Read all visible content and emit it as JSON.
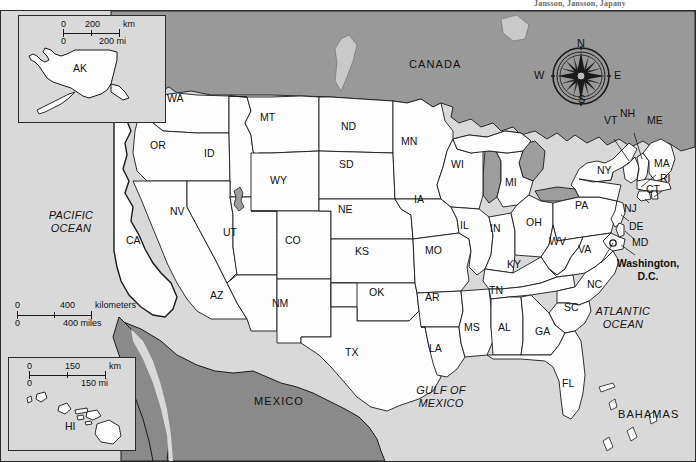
{
  "header": {
    "note": "Jansson, Jansson, Japany"
  },
  "map": {
    "title": "United States reference map",
    "countries": [
      {
        "name": "CANADA",
        "label": "CANADA",
        "x": 413,
        "y": 56
      },
      {
        "name": "MEXICO",
        "label": "MEXICO",
        "x": 258,
        "y": 394
      },
      {
        "name": "BAHAMAS",
        "label": "BAHAMAS",
        "x": 622,
        "y": 407
      }
    ],
    "waters": [
      {
        "name": "PACIFIC OCEAN",
        "line1": "PACIFIC",
        "line2": "OCEAN",
        "x": 38,
        "y": 210
      },
      {
        "name": "ATLANTIC OCEAN",
        "line1": "ATLANTIC",
        "line2": "OCEAN",
        "x": 589,
        "y": 305
      },
      {
        "name": "GULF OF MEXICO",
        "line1": "GULF OF",
        "line2": "MEXICO",
        "x": 413,
        "y": 384
      }
    ],
    "capital": {
      "name": "Washington, D.C.",
      "line1": "Washington,",
      "line2": "D.C.",
      "x": 613,
      "y": 258
    },
    "states": [
      {
        "code": "WA",
        "x": 175,
        "y": 98
      },
      {
        "code": "OR",
        "x": 158,
        "y": 145
      },
      {
        "code": "CA",
        "x": 134,
        "y": 240
      },
      {
        "code": "ID",
        "x": 212,
        "y": 153
      },
      {
        "code": "NV",
        "x": 178,
        "y": 211
      },
      {
        "code": "UT",
        "x": 231,
        "y": 232
      },
      {
        "code": "AZ",
        "x": 218,
        "y": 295
      },
      {
        "code": "MT",
        "x": 268,
        "y": 117
      },
      {
        "code": "WY",
        "x": 278,
        "y": 180
      },
      {
        "code": "CO",
        "x": 293,
        "y": 240
      },
      {
        "code": "NM",
        "x": 280,
        "y": 303
      },
      {
        "code": "ND",
        "x": 349,
        "y": 126
      },
      {
        "code": "SD",
        "x": 347,
        "y": 164
      },
      {
        "code": "NE",
        "x": 346,
        "y": 209
      },
      {
        "code": "KS",
        "x": 363,
        "y": 251
      },
      {
        "code": "OK",
        "x": 377,
        "y": 292
      },
      {
        "code": "TX",
        "x": 353,
        "y": 352
      },
      {
        "code": "MN",
        "x": 409,
        "y": 141
      },
      {
        "code": "IA",
        "x": 422,
        "y": 199
      },
      {
        "code": "MO",
        "x": 433,
        "y": 250
      },
      {
        "code": "AR",
        "x": 433,
        "y": 297
      },
      {
        "code": "LA",
        "x": 437,
        "y": 348
      },
      {
        "code": "WI",
        "x": 459,
        "y": 164
      },
      {
        "code": "IL",
        "x": 468,
        "y": 225
      },
      {
        "code": "MS",
        "x": 472,
        "y": 327
      },
      {
        "code": "MI",
        "x": 513,
        "y": 182
      },
      {
        "code": "IN",
        "x": 498,
        "y": 228
      },
      {
        "code": "OH",
        "x": 534,
        "y": 222
      },
      {
        "code": "KY",
        "x": 515,
        "y": 264
      },
      {
        "code": "TN",
        "x": 497,
        "y": 290
      },
      {
        "code": "AL",
        "x": 506,
        "y": 327
      },
      {
        "code": "GA",
        "x": 543,
        "y": 331
      },
      {
        "code": "FL",
        "x": 570,
        "y": 383
      },
      {
        "code": "SC",
        "x": 572,
        "y": 307
      },
      {
        "code": "NC",
        "x": 595,
        "y": 284
      },
      {
        "code": "VA",
        "x": 586,
        "y": 249
      },
      {
        "code": "WV",
        "x": 557,
        "y": 241
      },
      {
        "code": "PA",
        "x": 583,
        "y": 205
      },
      {
        "code": "NY",
        "x": 605,
        "y": 170
      },
      {
        "code": "VT",
        "x": 612,
        "y": 120
      },
      {
        "code": "NH",
        "x": 628,
        "y": 113
      },
      {
        "code": "ME",
        "x": 655,
        "y": 120
      },
      {
        "code": "MA",
        "x": 662,
        "y": 163
      },
      {
        "code": "RI",
        "x": 668,
        "y": 178
      },
      {
        "code": "CT",
        "x": 654,
        "y": 189
      },
      {
        "code": "NJ",
        "x": 632,
        "y": 208
      },
      {
        "code": "DE",
        "x": 637,
        "y": 226
      },
      {
        "code": "MD",
        "x": 640,
        "y": 242
      }
    ],
    "scalebar": {
      "name": "main-scalebar",
      "km_zero": "0",
      "km_mid": "400",
      "km_unit": "kilometers",
      "mi_zero": "0",
      "mi_label": "400 miles"
    }
  },
  "insets": {
    "alaska": {
      "label": "AK",
      "scale": {
        "km_zero": "0",
        "km_mid": "200",
        "km_unit": "km",
        "mi_zero": "0",
        "mi_label": "200 mi"
      }
    },
    "hawaii": {
      "label": "HI",
      "scale": {
        "km_zero": "0",
        "km_mid": "150",
        "km_unit": "km",
        "mi_zero": "0",
        "mi_label": "150 mi"
      }
    }
  },
  "compass": {
    "name": "compass-rose",
    "north": "N",
    "south": "S",
    "east": "E",
    "west": "W"
  },
  "colors": {
    "water": "#d9d9d9",
    "foreign_land": "#999999",
    "mexico_land": "#8a8a8a",
    "us_land": "#fdfdfd",
    "outline": "#1a1a1a"
  }
}
